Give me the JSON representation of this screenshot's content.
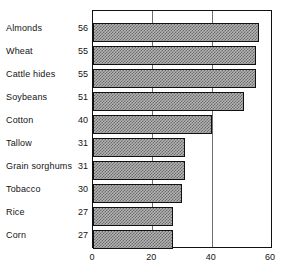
{
  "chart_data": {
    "type": "bar",
    "orientation": "horizontal",
    "title": "",
    "xlabel": "",
    "ylabel": "",
    "xlim": [
      0,
      60
    ],
    "xticks": [
      0,
      20,
      40,
      60
    ],
    "xtick_labels": [
      "0",
      "20",
      "40",
      "60"
    ],
    "grid": true,
    "grid_axis": "x",
    "legend": false,
    "categories": [
      "Almonds",
      "Wheat",
      "Cattle hides",
      "Soybeans",
      "Cotton",
      "Tallow",
      "Grain sorghums",
      "Tobacco",
      "Rice",
      "Corn"
    ],
    "values": [
      56,
      55,
      55,
      51,
      40,
      31,
      31,
      30,
      27,
      27
    ],
    "value_labels": [
      "56",
      "55",
      "55",
      "51",
      "40",
      "31",
      "31",
      "30",
      "27",
      "27"
    ],
    "bar_fill": "#b3b3b3",
    "bar_hatch": "checkerboard",
    "bar_edge_color": "#111111",
    "frame_color": "#111111",
    "gridline_color": "#6e6e6e"
  }
}
